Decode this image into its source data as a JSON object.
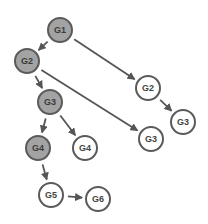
{
  "diagram": {
    "colors": {
      "node_fill_highlight": "#a3a3a3",
      "node_fill_default": "#ffffff",
      "node_stroke": "#5a5a5a",
      "edge": "#555555"
    },
    "nodes": [
      {
        "id": "n1",
        "label": "G1",
        "x": 60,
        "y": 30,
        "style": "grey"
      },
      {
        "id": "n2",
        "label": "G2",
        "x": 27,
        "y": 61,
        "style": "grey"
      },
      {
        "id": "n3",
        "label": "G3",
        "x": 50,
        "y": 102,
        "style": "grey"
      },
      {
        "id": "n4",
        "label": "G4",
        "x": 38,
        "y": 148,
        "style": "grey"
      },
      {
        "id": "n5",
        "label": "G4",
        "x": 85,
        "y": 148,
        "style": "white"
      },
      {
        "id": "n6",
        "label": "G5",
        "x": 51,
        "y": 195,
        "style": "white"
      },
      {
        "id": "n7",
        "label": "G6",
        "x": 98,
        "y": 199,
        "style": "white"
      },
      {
        "id": "n8",
        "label": "G2",
        "x": 148,
        "y": 88,
        "style": "white"
      },
      {
        "id": "n9",
        "label": "G3",
        "x": 183,
        "y": 122,
        "style": "white"
      },
      {
        "id": "n10",
        "label": "G3",
        "x": 151,
        "y": 139,
        "style": "white"
      }
    ],
    "edges": [
      {
        "from": "n1",
        "to": "n2"
      },
      {
        "from": "n1",
        "to": "n8"
      },
      {
        "from": "n8",
        "to": "n9"
      },
      {
        "from": "n2",
        "to": "n3"
      },
      {
        "from": "n2",
        "to": "n10"
      },
      {
        "from": "n3",
        "to": "n4"
      },
      {
        "from": "n3",
        "to": "n5"
      },
      {
        "from": "n4",
        "to": "n6"
      },
      {
        "from": "n6",
        "to": "n7"
      }
    ]
  }
}
